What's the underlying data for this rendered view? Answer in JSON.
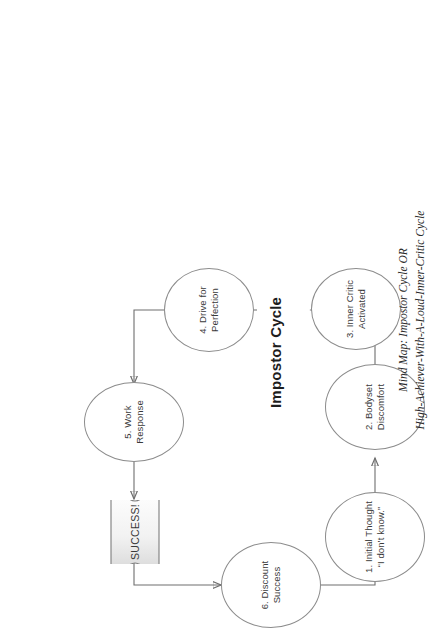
{
  "page": {
    "background_color": "#ffffff",
    "orientation": "portrait-rotated-landscape-diagram",
    "rotation_degrees": -90
  },
  "diagram": {
    "title": "Impostor Cycle",
    "type": "cycle-flowchart",
    "node_outline_color": "#8c8c8c",
    "text_color": "#3a3a3a",
    "edge_color": "#6e6e6e",
    "banner_fill_start": "#ffffff",
    "banner_fill_end": "#d9d9d9",
    "nodes": [
      {
        "id": "n1",
        "label": "1. Initial Thought\n“I don’t know.”",
        "shape": "ellipse"
      },
      {
        "id": "n2",
        "label": "2. Bodyset\nDiscomfort",
        "shape": "ellipse"
      },
      {
        "id": "n3",
        "label": "3. Inner Critic\nActivated",
        "shape": "ellipse"
      },
      {
        "id": "n4",
        "label": "4. Drive for\nPerfection",
        "shape": "ellipse"
      },
      {
        "id": "n5",
        "label": "5. Work Response",
        "shape": "ellipse"
      },
      {
        "id": "n6",
        "label": "6. Discount\nSuccess",
        "shape": "ellipse"
      }
    ],
    "banner": {
      "id": "success",
      "label": "SUCCESS!",
      "shape": "wave-document"
    },
    "edges": [
      {
        "from": "n1",
        "to": "n2"
      },
      {
        "from": "n2",
        "to": "n3"
      },
      {
        "from": "n3",
        "to": "n4"
      },
      {
        "from": "n4",
        "to": "n5"
      },
      {
        "from": "n5",
        "to": "success"
      },
      {
        "from": "success",
        "to": "n6"
      },
      {
        "from": "n6",
        "to": "n1"
      }
    ]
  },
  "caption": {
    "line1": "Mind Map: Impostor Cycle OR",
    "line2": "High-Achiever-With-A-Loud-Inner-Critic Cycle"
  }
}
